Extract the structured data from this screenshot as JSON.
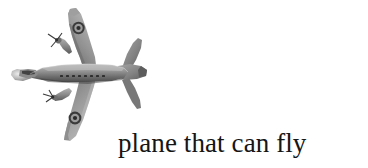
{
  "page": {
    "background_color": "#ffffff",
    "width": 368,
    "height": 168
  },
  "figure": {
    "alt_name": "airplane-photograph",
    "style": "grayscale photograph",
    "tones": {
      "highlight": "#d8d8d8",
      "midtone": "#8e8e8e",
      "shadow": "#4a4a4a",
      "darkest": "#232323"
    },
    "parts": {
      "fuselage": "fuselage",
      "nose": "nose",
      "cockpit": "cockpit-canopy",
      "port_wing": "upper-wing",
      "starboard_wing": "lower-wing",
      "tail_fin": "tail-fin",
      "horizontal_stabilizer": "horizontal-stabilizer",
      "engine_upper": "upper-engine-nacelle",
      "engine_lower": "lower-engine-nacelle",
      "propeller_upper": "upper-propeller",
      "propeller_lower": "lower-propeller",
      "roundel_upper": "upper-wing-roundel",
      "roundel_lower": "lower-wing-roundel"
    }
  },
  "caption": {
    "text": "plane that can fly",
    "color": "#151515",
    "font_size_px": 27
  }
}
